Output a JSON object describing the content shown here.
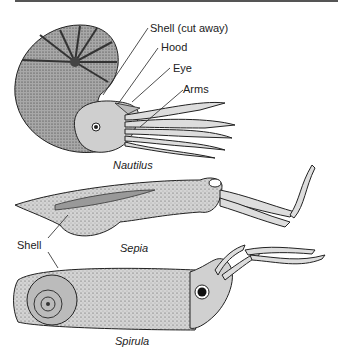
{
  "figure": {
    "specimens": [
      {
        "name": "Nautilus",
        "labels": [
          "Shell (cut away)",
          "Hood",
          "Eye",
          "Arms"
        ]
      },
      {
        "name": "Sepia",
        "labels": [
          "Shell"
        ]
      },
      {
        "name": "Spirula",
        "labels": []
      }
    ],
    "labels": {
      "shell_cut_away": "Shell (cut away)",
      "hood": "Hood",
      "eye": "Eye",
      "arms": "Arms",
      "shell": "Shell"
    },
    "captions": {
      "nautilus": "Nautilus",
      "sepia": "Sepia",
      "spirula": "Spirula"
    }
  }
}
